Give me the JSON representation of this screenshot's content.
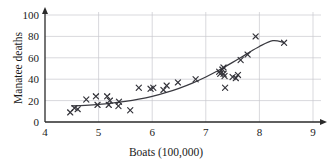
{
  "chart_data": {
    "type": "scatter",
    "title": "",
    "xlabel": "Boats (100,000)",
    "ylabel": "Manatee deaths",
    "xlim": [
      4,
      9
    ],
    "ylim": [
      0,
      100
    ],
    "xticks": [
      4,
      5,
      6,
      7,
      8,
      9
    ],
    "yticks": [
      0,
      20,
      40,
      60,
      80,
      100
    ],
    "grid": true,
    "legend": "none",
    "series": [
      {
        "name": "Manatee deaths vs boats",
        "marker": "x",
        "color": "#33333a",
        "points": [
          [
            4.47,
            9
          ],
          [
            4.55,
            13
          ],
          [
            4.61,
            12
          ],
          [
            4.77,
            21
          ],
          [
            4.95,
            24
          ],
          [
            4.98,
            16
          ],
          [
            5.16,
            24
          ],
          [
            5.19,
            16
          ],
          [
            5.21,
            20
          ],
          [
            5.37,
            15
          ],
          [
            5.38,
            19
          ],
          [
            5.59,
            11
          ],
          [
            5.75,
            32
          ],
          [
            5.97,
            31
          ],
          [
            6.02,
            32
          ],
          [
            6.21,
            30
          ],
          [
            6.27,
            34
          ],
          [
            6.48,
            37
          ],
          [
            6.81,
            40
          ],
          [
            7.25,
            47
          ],
          [
            7.27,
            45
          ],
          [
            7.31,
            49
          ],
          [
            7.33,
            51
          ],
          [
            7.33,
            45
          ],
          [
            7.35,
            43
          ],
          [
            7.36,
            32
          ],
          [
            7.5,
            42
          ],
          [
            7.56,
            41
          ],
          [
            7.6,
            44
          ],
          [
            7.65,
            58
          ],
          [
            7.78,
            63
          ],
          [
            7.93,
            80
          ],
          [
            8.46,
            74
          ]
        ]
      }
    ],
    "fit_curve": {
      "name": "exponential trend",
      "color": "#33333a",
      "points": [
        [
          4.5,
          15.0
        ],
        [
          4.75,
          15.6
        ],
        [
          5.0,
          16.4
        ],
        [
          5.25,
          17.6
        ],
        [
          5.5,
          19.2
        ],
        [
          5.75,
          21.3
        ],
        [
          6.0,
          24.0
        ],
        [
          6.25,
          27.4
        ],
        [
          6.5,
          31.5
        ],
        [
          6.75,
          36.4
        ],
        [
          7.0,
          42.1
        ],
        [
          7.25,
          48.6
        ],
        [
          7.5,
          55.7
        ],
        [
          7.75,
          63.2
        ],
        [
          8.0,
          70.6
        ],
        [
          8.25,
          76.0
        ],
        [
          8.45,
          74.5
        ]
      ]
    }
  },
  "axes": {
    "x_tick_labels": [
      "4",
      "5",
      "6",
      "7",
      "8",
      "9"
    ],
    "y_tick_labels": [
      "0",
      "20",
      "40",
      "60",
      "80",
      "100"
    ],
    "x_axis_title": "Boats (100,000)",
    "y_axis_title": "Manatee deaths"
  },
  "colors": {
    "marker": "#33333a",
    "curve": "#3a3a40",
    "axis": "#2a2a2a",
    "grid": "#c9c9cf",
    "background": "#ffffff",
    "text": "#1a1a1a"
  }
}
